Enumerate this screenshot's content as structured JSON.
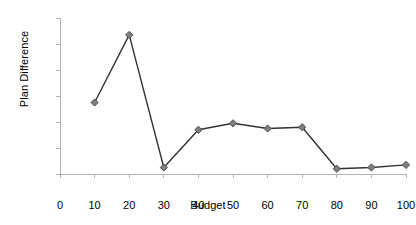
{
  "chart_data": {
    "type": "line",
    "title": "",
    "subtitle": "",
    "xlabel": "Budget",
    "ylabel": "Plan Difference",
    "x": [
      10,
      20,
      30,
      40,
      50,
      60,
      70,
      80,
      90,
      100
    ],
    "values": [
      0.55,
      1.07,
      0.05,
      0.34,
      0.39,
      0.35,
      0.36,
      0.04,
      0.05,
      0.07
    ],
    "series": [
      {
        "name": "Plan Difference",
        "values": [
          0.55,
          1.07,
          0.05,
          0.34,
          0.39,
          0.35,
          0.36,
          0.04,
          0.05,
          0.07
        ]
      }
    ],
    "xlim": [
      0,
      100
    ],
    "ylim": [
      0,
      1.2
    ],
    "xticks": [
      0,
      10,
      20,
      30,
      40,
      50,
      60,
      70,
      80,
      90,
      100
    ],
    "xtick_labels": [
      "0",
      "10",
      "20",
      "30",
      "40",
      "50",
      "60",
      "70",
      "80",
      "90",
      "100"
    ],
    "yticks": [
      0,
      0.2,
      0.4,
      0.6,
      0.8,
      1.0,
      1.2
    ],
    "ytick_labels": [
      "0",
      "0.2",
      "0.4",
      "0.6",
      "0.8",
      "1",
      "1.2"
    ],
    "grid": false,
    "legend": false,
    "legend_position": "none",
    "marker": "diamond",
    "colors": {
      "line": "#333333",
      "marker_fill": "#808080",
      "marker_stroke": "#4d4d4d",
      "axis": "#b3b3b3",
      "text": "#000000",
      "background": "#ffffff"
    },
    "annotations": []
  }
}
